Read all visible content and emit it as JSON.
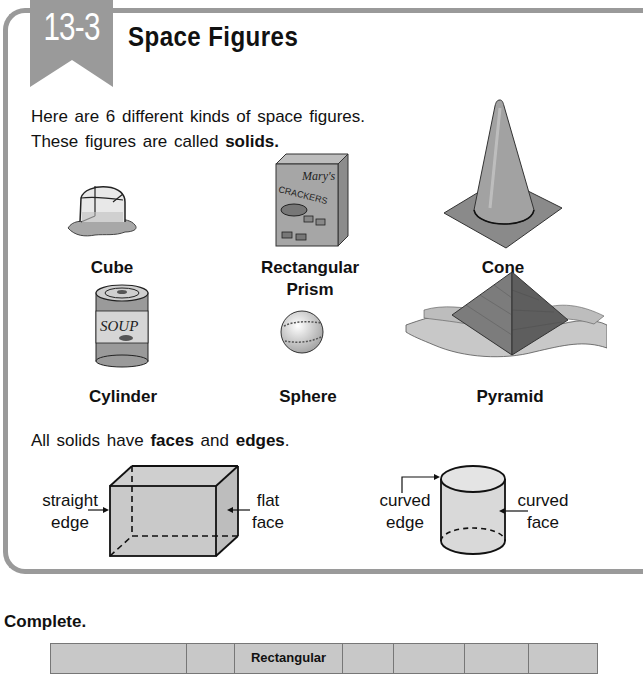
{
  "lesson": {
    "number": "13-3",
    "title": "Space Figures"
  },
  "intro": {
    "line1": "Here are 6 different kinds of space figures.",
    "line2_prefix": "These figures are called ",
    "line2_bold": "solids."
  },
  "figures": [
    {
      "name": "Cube",
      "icon": "melting-ice-cube-icon"
    },
    {
      "name": "Rectangular",
      "name_line2": "Prism",
      "icon": "cracker-box-icon",
      "box_text_1": "Mary's",
      "box_text_2": "CRACKERS"
    },
    {
      "name": "Cone",
      "icon": "traffic-cone-icon"
    },
    {
      "name": "Cylinder",
      "icon": "soup-can-icon",
      "can_text": "SOUP"
    },
    {
      "name": "Sphere",
      "icon": "baseball-icon"
    },
    {
      "name": "Pyramid",
      "icon": "pyramid-icon"
    }
  ],
  "faces_edges": {
    "prefix": "All solids have ",
    "bold1": "faces",
    "middle": " and ",
    "bold2": "edges",
    "suffix": "."
  },
  "diagrams": {
    "box": {
      "left_label_1": "straight",
      "left_label_2": "edge",
      "right_label_1": "flat",
      "right_label_2": "face"
    },
    "cylinder": {
      "left_label_1": "curved",
      "left_label_2": "edge",
      "right_label_1": "curved",
      "right_label_2": "face"
    }
  },
  "exercise": {
    "heading": "Complete.",
    "table_header": [
      "",
      "",
      "Rectangular",
      "",
      "",
      "",
      ""
    ]
  },
  "colors": {
    "frame": "#9a9a9a",
    "banner": "#9a9a9a",
    "table_bg": "#c8c8c8"
  }
}
